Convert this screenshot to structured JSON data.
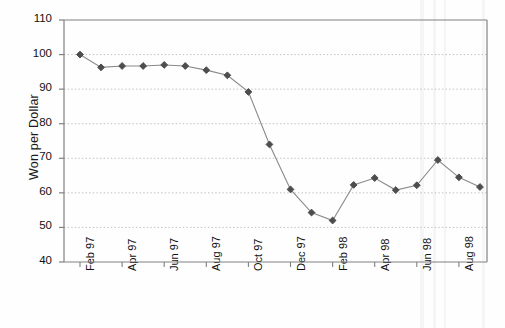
{
  "chart_data": {
    "type": "line",
    "title": "",
    "xlabel": "",
    "ylabel": "Won per Dollar",
    "ylim": [
      40,
      110
    ],
    "ytick_values": [
      40,
      50,
      60,
      70,
      80,
      90,
      100,
      110
    ],
    "ytick_labels": [
      "40",
      "50",
      "60",
      "70",
      "80",
      "90",
      "100",
      "110"
    ],
    "grid": "horizontal-dotted",
    "legend": "none",
    "x": [
      "Feb 97",
      "Mar 97",
      "Apr 97",
      "May 97",
      "Jun 97",
      "Jul 97",
      "Aug 97",
      "Sep 97",
      "Oct 97",
      "Nov 97",
      "Dec 97",
      "Jan 98",
      "Feb 98",
      "Mar 98",
      "Apr 98",
      "May 98",
      "Jun 98",
      "Jul 98",
      "Aug 98",
      "Sep 98"
    ],
    "xtick_labels": [
      "Feb 97",
      "Apr 97",
      "Jun 97",
      "Aug 97",
      "Oct 97",
      "Dec 97",
      "Feb 98",
      "Apr 98",
      "Jun 98",
      "Aug 98"
    ],
    "values": [
      100.0,
      96.3,
      96.7,
      96.7,
      97.0,
      96.7,
      95.5,
      94.0,
      89.2,
      74.0,
      61.0,
      54.3,
      52.0,
      62.3,
      64.3,
      60.8,
      62.2,
      69.5,
      64.5,
      61.7
    ],
    "series": [
      {
        "name": "Won per Dollar",
        "marker": "diamond",
        "marker_color": "#4d4d4d",
        "line_color": "#8a8a8a",
        "values": [
          100.0,
          96.3,
          96.7,
          96.7,
          97.0,
          96.7,
          95.5,
          94.0,
          89.2,
          74.0,
          61.0,
          54.3,
          52.0,
          62.3,
          64.3,
          60.8,
          62.2,
          69.5,
          64.5,
          61.7
        ]
      }
    ]
  },
  "style": {
    "axis_color": "#808080",
    "grid_color": "#b0b0b0",
    "text_color": "#111111",
    "background": "#ffffff"
  }
}
